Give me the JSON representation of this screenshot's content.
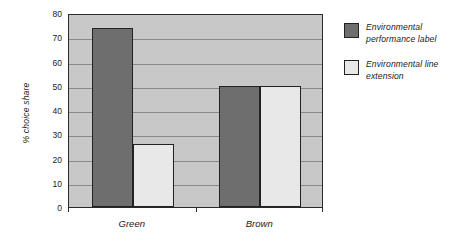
{
  "chart_data": {
    "type": "bar",
    "title": "",
    "subtitle": "",
    "xlabel": "",
    "ylabel": "% choice share",
    "categories": [
      "Green",
      "Brown"
    ],
    "series": [
      {
        "name": "Environmental performance label",
        "color": "#6e6e6e",
        "values": [
          74,
          50
        ]
      },
      {
        "name": "Environmental line extension",
        "color": "#e8e8e8",
        "values": [
          26,
          50
        ]
      }
    ],
    "ylim": [
      0,
      80
    ],
    "ytick_step": 10,
    "yticks": [
      0,
      10,
      20,
      30,
      40,
      50,
      60,
      70,
      80
    ],
    "ytick_labels": [
      "0",
      "10",
      "20",
      "30",
      "40",
      "50",
      "60",
      "70",
      "80"
    ],
    "grid": true,
    "grid_axis": "y",
    "legend_position": "right",
    "plot_background": "#c8c8c8",
    "gridline_color": "#8a8a8a",
    "axis_color": "#2a2a2a",
    "annotations": []
  },
  "legend": {
    "entries": [
      {
        "label": "Environmental performance label",
        "swatch": "series-dark"
      },
      {
        "label": "Environmental line extension",
        "swatch": "series-light"
      }
    ]
  }
}
